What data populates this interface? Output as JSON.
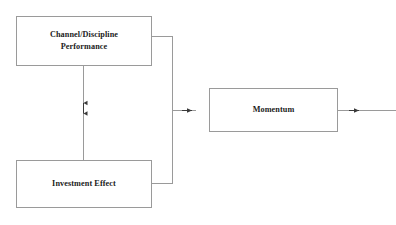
{
  "diagram": {
    "type": "flowchart",
    "background_color": "#ffffff",
    "line_color": "#9a9a9a",
    "text_color": "#1b1b1b",
    "nodes": [
      {
        "id": "channel",
        "label": "Channel/Discipline\nPerformance",
        "shape": "rectangle"
      },
      {
        "id": "investment",
        "label": "Investment Effect",
        "shape": "rectangle"
      },
      {
        "id": "momentum",
        "label": "Momentum",
        "shape": "rectangle"
      }
    ],
    "edges": [
      {
        "id": "channel-investment",
        "from": "channel",
        "to": "investment",
        "direction": "bidirectional",
        "style": "vertical"
      },
      {
        "id": "channel-momentum",
        "from": "channel",
        "to": "momentum",
        "direction": "forward",
        "style": "orthogonal"
      },
      {
        "id": "investment-momentum",
        "from": "investment",
        "to": "momentum",
        "direction": "forward",
        "style": "orthogonal"
      },
      {
        "id": "momentum-output",
        "from": "momentum",
        "to": "output",
        "direction": "forward",
        "style": "horizontal"
      }
    ]
  }
}
